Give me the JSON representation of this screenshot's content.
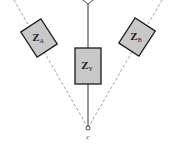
{
  "diagram": {
    "type": "circuit-impedance-network",
    "colors": {
      "box_fill": "#c8c8c8",
      "box_stroke": "#1a1a1a",
      "solid_line": "#555555",
      "dashed_line": "#888888",
      "background": "#ffffff"
    },
    "impedances": [
      {
        "id": "ZA",
        "symbol": "Z",
        "subscript": "A",
        "position": "upper-left",
        "rotation_deg": -33
      },
      {
        "id": "ZS",
        "symbol": "Z",
        "subscript": "Y",
        "position": "center",
        "rotation_deg": 0
      },
      {
        "id": "ZB",
        "symbol": "Z",
        "subscript": "B",
        "position": "upper-right",
        "rotation_deg": 33
      }
    ],
    "nodes": [
      {
        "id": "top",
        "label": "",
        "position": "top-center"
      },
      {
        "id": "c",
        "label": "c",
        "position": "bottom-center"
      }
    ],
    "edges": [
      {
        "from": "top",
        "to": "ZS",
        "style": "solid"
      },
      {
        "from": "ZS",
        "to": "c",
        "style": "solid"
      },
      {
        "from": "c",
        "to": "ZA",
        "style": "dashed"
      },
      {
        "from": "c",
        "to": "ZB",
        "style": "dashed"
      }
    ]
  }
}
